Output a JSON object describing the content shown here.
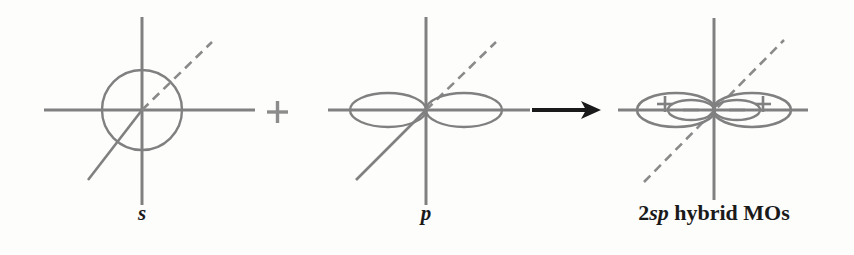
{
  "figure": {
    "background_color": "#fdfdfc",
    "orbital_stroke_color": "#808080",
    "axis_color": "#808080",
    "arrow_color": "#1a1a1a",
    "label_color": "#1a1a1a",
    "width": 854,
    "height": 255
  },
  "panels": [
    {
      "id": "s-orbital",
      "label": "s",
      "label_style": "italic",
      "origin": {
        "x": 142,
        "y": 110
      },
      "axis_x": {
        "x1": 44,
        "x2": 255
      },
      "axis_y": {
        "y1": 17,
        "y2": 205
      },
      "shape": "circle",
      "circle_radius": 40,
      "diagonal": {
        "solid_from": {
          "x": 88,
          "y": 180
        },
        "solid_to": {
          "x": 142,
          "y": 110
        },
        "dashed_from": {
          "x": 142,
          "y": 110
        },
        "dashed_to": {
          "x": 212,
          "y": 42
        }
      },
      "lobe_signs": []
    },
    {
      "id": "p-orbital",
      "label": "p",
      "label_style": "italic",
      "origin": {
        "x": 426,
        "y": 110
      },
      "axis_x": {
        "x1": 328,
        "x2": 530
      },
      "axis_y": {
        "y1": 17,
        "y2": 205
      },
      "shape": "two-lobes",
      "lobe_rx": 38,
      "lobe_ry": 17,
      "diagonal": {
        "solid_from": {
          "x": 356,
          "y": 180
        },
        "solid_to": {
          "x": 426,
          "y": 110
        },
        "dashed_from": {
          "x": 426,
          "y": 110
        },
        "dashed_to": {
          "x": 496,
          "y": 42
        }
      },
      "lobe_signs": []
    },
    {
      "id": "sp-hybrid-orbitals",
      "label": "2sp hybrid MOs",
      "label_prefix": "2",
      "label_italic_part": "sp",
      "label_suffix": " hybrid MOs",
      "label_style": "bold",
      "origin": {
        "x": 714,
        "y": 110
      },
      "axis_x": {
        "x1": 618,
        "x2": 808
      },
      "axis_y": {
        "y1": 18,
        "y2": 200
      },
      "shape": "four-lobes",
      "outer_lobe_rx": 39,
      "outer_lobe_ry": 17,
      "inner_lobe_rx": 23,
      "inner_lobe_ry": 10,
      "diagonal": {
        "dashed_from": {
          "x": 644,
          "y": 182
        },
        "dashed_to": {
          "x": 784,
          "y": 40
        }
      },
      "lobe_signs": [
        {
          "sign": "+",
          "x": 665,
          "y": 104,
          "lobe": "outer-left"
        },
        {
          "sign": "−",
          "x": 691,
          "y": 110,
          "lobe": "inner-left"
        },
        {
          "sign": "−",
          "x": 737,
          "y": 110,
          "lobe": "inner-right"
        },
        {
          "sign": "+",
          "x": 763,
          "y": 104,
          "lobe": "outer-right"
        }
      ]
    }
  ],
  "operators": [
    {
      "id": "plus-operator",
      "symbol": "+",
      "x": 277,
      "y": 112,
      "color": "#8c8c8c"
    }
  ],
  "arrow": {
    "id": "yields-arrow",
    "x1": 532,
    "x2": 600,
    "y": 110,
    "color": "#1a1a1a"
  }
}
